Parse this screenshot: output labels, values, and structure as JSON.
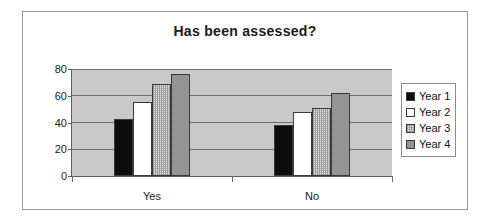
{
  "chart_data": {
    "type": "bar",
    "title": "Has been assessed?",
    "xlabel": "",
    "ylabel": "",
    "categories": [
      "Yes",
      "No"
    ],
    "series": [
      {
        "name": "Year 1",
        "values": [
          43,
          38
        ],
        "color": "#0c0c0c",
        "pattern": "solid-black"
      },
      {
        "name": "Year 2",
        "values": [
          55,
          48
        ],
        "color": "#ffffff",
        "pattern": "solid-white"
      },
      {
        "name": "Year 3",
        "values": [
          69,
          51
        ],
        "color": "#e2e2e2",
        "pattern": "fine-dotted"
      },
      {
        "name": "Year 4",
        "values": [
          76,
          62
        ],
        "color": "#949494",
        "pattern": "solid-gray"
      }
    ],
    "ylim": [
      0,
      80
    ],
    "yticks": [
      0,
      20,
      40,
      60,
      80
    ],
    "ytick_labels": [
      "0",
      "20",
      "40",
      "60",
      "80"
    ],
    "grid": true,
    "legend_position": "right",
    "plot_background": "#c9c9c9",
    "figure_background": "#ffffff",
    "axis_color": "#5d5d5d",
    "gridline_color": "#6e6e6e"
  },
  "legend": {
    "entries": [
      {
        "label": "Year 1"
      },
      {
        "label": "Year 2"
      },
      {
        "label": "Year 3"
      },
      {
        "label": "Year 4"
      }
    ]
  }
}
